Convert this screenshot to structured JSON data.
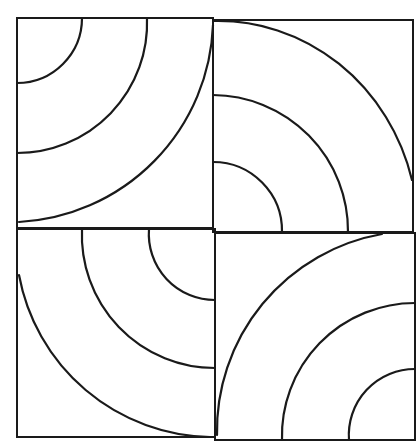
{
  "figure": {
    "type": "quarter-circle tile pattern",
    "stroke_color": "#1a1a1a",
    "background": "#ffffff",
    "tiles": [
      {
        "id": "top-left",
        "rect": [
          17,
          18,
          196,
          210
        ],
        "arc_center": "top-left",
        "radii": [
          65,
          130,
          205
        ]
      },
      {
        "id": "top-right",
        "rect": [
          213,
          20,
          200,
          212
        ],
        "arc_center": "bottom-left",
        "radii": [
          68,
          135,
          200
        ]
      },
      {
        "id": "bottom-left",
        "rect": [
          17,
          228,
          198,
          209
        ],
        "arc_center": "top-right",
        "radii": [
          66,
          133,
          198
        ]
      },
      {
        "id": "bottom-right",
        "rect": [
          215,
          233,
          200,
          207
        ],
        "arc_center": "bottom-right",
        "radii": [
          65,
          132,
          200
        ]
      }
    ]
  }
}
